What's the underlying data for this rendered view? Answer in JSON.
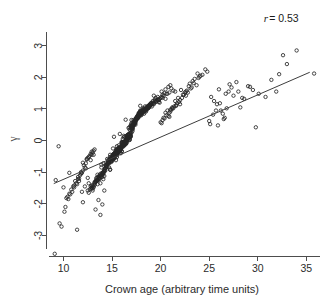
{
  "chart_data": {
    "type": "scatter",
    "title": "",
    "xlabel": "Crown age (arbitrary time units)",
    "ylabel": "γ",
    "xlim": [
      8.2,
      36.2
    ],
    "ylim": [
      -3.65,
      3.75
    ],
    "grid": false,
    "legend": null,
    "xticks": [
      10,
      15,
      20,
      25,
      30,
      35
    ],
    "xtick_labels": [
      "10",
      "15",
      "20",
      "25",
      "30",
      "35"
    ],
    "yticks": [
      -3,
      -2,
      -1,
      0,
      1,
      2,
      3
    ],
    "ytick_labels": [
      "-3",
      "-2",
      "-1",
      "0",
      "1",
      "2",
      "3"
    ],
    "ytick_label_rotation": 90,
    "marker": "open-circle",
    "marker_size_px": 3.4,
    "marker_color": "#262626",
    "point_count": 704,
    "annotations": [
      {
        "name": "correlation",
        "text_italic": "r",
        "text": "= 0.53",
        "full_text": "r = 0.53",
        "value": 0.53,
        "x_frac": 0.905,
        "y_frac": 0.072
      }
    ],
    "fit_line": {
      "type": "linear-regression",
      "x_start": 9.0,
      "y_start": -1.36,
      "x_end": 35.35,
      "y_end": 2.16,
      "slope": 0.1336,
      "intercept": -2.562,
      "color": "#3d3d3d"
    },
    "x": [
      13.1,
      15.2,
      16.4,
      14.8,
      17.9,
      12.6,
      19.3,
      16.8,
      15.5,
      18.2,
      14.1,
      17.2,
      16.0,
      13.9,
      20.1,
      15.8,
      18.7,
      16.3,
      14.6,
      17.5,
      12.9,
      19.8,
      15.1,
      16.9,
      13.4,
      18.0,
      17.1,
      14.3,
      16.6,
      15.9,
      19.1,
      13.7,
      17.8,
      16.2,
      14.9,
      18.4,
      15.4,
      20.5,
      16.7,
      13.2,
      17.3,
      15.0,
      18.9,
      16.1,
      14.4,
      19.5,
      13.8,
      17.6,
      15.7,
      16.5,
      18.1,
      14.0,
      20.8,
      15.3,
      17.0,
      13.5,
      18.6,
      16.8,
      14.7,
      19.0,
      15.6,
      17.4,
      13.0,
      18.3,
      16.4,
      14.2,
      20.2,
      15.9,
      17.7,
      13.6,
      18.8,
      16.0,
      14.5,
      19.4,
      15.2,
      17.2,
      12.8,
      18.5,
      16.6,
      14.1,
      21.0,
      15.8,
      17.9,
      13.3,
      18.2,
      16.3,
      14.8,
      19.7,
      15.5,
      17.5,
      12.5,
      18.0,
      16.9,
      14.0,
      20.4,
      15.1,
      17.1,
      13.9,
      18.7,
      16.2,
      22.1,
      21.5,
      23.0,
      20.7,
      22.8,
      21.2,
      23.5,
      20.3,
      24.1,
      21.8,
      22.4,
      20.9,
      23.8,
      21.0,
      22.0,
      24.6,
      20.6,
      23.2,
      21.6,
      22.6,
      11.5,
      12.2,
      10.9,
      11.8,
      12.4,
      10.5,
      11.2,
      12.7,
      11.0,
      12.0,
      10.7,
      11.6,
      12.9,
      11.4,
      12.3,
      10.2,
      11.9,
      12.5,
      11.1,
      12.8,
      25.2,
      26.0,
      25.8,
      27.1,
      26.4,
      25.5,
      28.0,
      26.8,
      25.0,
      27.5,
      29.2,
      26.2,
      28.6,
      25.9,
      27.8,
      30.1,
      26.6,
      29.5,
      28.2,
      31.4,
      32.2,
      30.8,
      33.0,
      31.9,
      35.8,
      34.0,
      29.8,
      32.6,
      16.1,
      15.4,
      17.6,
      16.8,
      14.9,
      18.3,
      15.7,
      17.0,
      16.4,
      14.2,
      19.2,
      15.1,
      17.8,
      16.6,
      13.8,
      18.7,
      15.9,
      17.3,
      16.0,
      14.6,
      19.9,
      15.5,
      17.1,
      16.9,
      13.4,
      18.1,
      15.2,
      17.7,
      16.3,
      14.3,
      20.6,
      15.8,
      17.4,
      16.7,
      13.1,
      18.9,
      15.0,
      17.9,
      16.5,
      14.8,
      19.6,
      15.6,
      17.2,
      16.1,
      13.7,
      18.4,
      15.3,
      17.5,
      16.2,
      14.0,
      20.9,
      15.7,
      17.0,
      16.8,
      12.7,
      18.6,
      15.4,
      18.0,
      16.0,
      14.4,
      19.3,
      15.9,
      17.6,
      16.4,
      13.2,
      18.8,
      15.1,
      17.3,
      16.6,
      14.7,
      20.0,
      15.5,
      17.8,
      16.2,
      13.6,
      18.2,
      15.8,
      17.1,
      16.9,
      14.1,
      21.3,
      15.3,
      17.7,
      16.5,
      12.9,
      18.5,
      15.6,
      17.4,
      16.0,
      14.5,
      19.8,
      15.2,
      17.9,
      16.3,
      13.3,
      18.3,
      15.9,
      17.2,
      16.7,
      14.9,
      16.2,
      15.5,
      17.5,
      16.9,
      14.3,
      18.0,
      15.0,
      17.6,
      16.1,
      13.5,
      19.1,
      15.7,
      17.0,
      16.8,
      14.0,
      18.7,
      15.4,
      17.8,
      16.4,
      14.6,
      20.3,
      15.1,
      17.3,
      16.0,
      13.0,
      18.4,
      15.8,
      17.7,
      16.6,
      14.2,
      19.4,
      15.3,
      17.1,
      16.2,
      13.9,
      18.9,
      15.6,
      17.9,
      16.5,
      14.8,
      21.1,
      15.0,
      17.4,
      16.3,
      12.6,
      18.1,
      15.9,
      17.2,
      16.7,
      14.4,
      19.7,
      15.5,
      17.6,
      16.1,
      13.8,
      18.6,
      15.2,
      17.0,
      16.9,
      14.1,
      20.7,
      15.7,
      17.5,
      16.4,
      13.4,
      18.3,
      15.4,
      17.8,
      16.0,
      14.7,
      19.0,
      15.8,
      17.3,
      16.6,
      13.7,
      18.8,
      15.1,
      17.7,
      16.2,
      14.3,
      22.3,
      21.7,
      20.5,
      22.9,
      21.1,
      23.4,
      20.8,
      22.5,
      21.4,
      23.9,
      20.2,
      22.7,
      21.9,
      24.3,
      20.4,
      23.1,
      21.3,
      22.2,
      24.8,
      20.0,
      12.1,
      11.7,
      12.6,
      11.3,
      13.0,
      10.8,
      12.8,
      11.5,
      13.2,
      10.4,
      12.3,
      11.1,
      12.9,
      10.6,
      11.8,
      13.1,
      12.0,
      11.6,
      10.1,
      12.4,
      16.5,
      15.2,
      17.9,
      16.1,
      14.5,
      18.2,
      15.8,
      17.4,
      16.7,
      13.3,
      19.5,
      15.4,
      17.0,
      16.3,
      14.0,
      18.7,
      15.0,
      17.6,
      16.9,
      14.6,
      20.1,
      15.6,
      17.2,
      16.4,
      13.6,
      18.0,
      15.3,
      17.8,
      16.0,
      14.2,
      19.2,
      15.9,
      17.5,
      16.6,
      13.1,
      18.5,
      15.7,
      17.1,
      16.2,
      14.9,
      21.5,
      15.1,
      17.7,
      16.8,
      12.8,
      18.9,
      15.5,
      17.3,
      16.5,
      14.4,
      19.8,
      15.2,
      17.9,
      16.1,
      13.5,
      18.4,
      15.8,
      17.0,
      16.7,
      14.7,
      9.2,
      9.8,
      9.5,
      10.0,
      9.6,
      10.3,
      9.1,
      10.6,
      16.0,
      15.5,
      17.5,
      16.5,
      14.5,
      18.5,
      15.0,
      17.0,
      16.8,
      14.0,
      19.0,
      15.7,
      17.7,
      16.2,
      13.5,
      18.2,
      15.3,
      17.2,
      16.6,
      14.8,
      20.5,
      15.9,
      17.4,
      16.3,
      13.8,
      18.8,
      15.1,
      17.8,
      16.0,
      14.3,
      19.6,
      15.6,
      17.1,
      16.9,
      13.0,
      18.1,
      15.4,
      17.6,
      16.4,
      14.6,
      22.0,
      21.2,
      20.9,
      23.3,
      21.6,
      22.6,
      20.1,
      24.0,
      21.0,
      23.7,
      16.3,
      15.8,
      17.3,
      16.1,
      14.1,
      18.6,
      15.2,
      17.9,
      16.7,
      14.9,
      19.3,
      15.5,
      17.5,
      16.0,
      13.2,
      18.0,
      15.9,
      17.2,
      16.8,
      14.4,
      20.2,
      15.0,
      17.6,
      16.5,
      13.7,
      18.4,
      15.6,
      17.0,
      16.2,
      14.2,
      19.9,
      15.3,
      17.8,
      16.6,
      12.9,
      18.3,
      15.7,
      17.4,
      16.4,
      14.5,
      12.2,
      13.6,
      11.9,
      14.0,
      12.5,
      13.8,
      11.4,
      14.2,
      12.0,
      13.3,
      25.4,
      26.7,
      25.1,
      27.3,
      26.1,
      28.4,
      25.7,
      27.0,
      26.5,
      29.0,
      16.2,
      15.4,
      17.1,
      16.6,
      14.7,
      18.8,
      15.1,
      17.7,
      16.0,
      13.4,
      19.1,
      15.8,
      17.3,
      16.9,
      14.1,
      18.5,
      15.5,
      17.0,
      16.3,
      14.8
    ],
    "y": [
      -0.45,
      0.12,
      0.66,
      -0.92,
      1.1,
      -1.35,
      1.42,
      0.35,
      -0.18,
      0.88,
      -1.05,
      0.54,
      -0.33,
      -0.76,
      1.55,
      0.21,
      1.02,
      -0.08,
      -0.61,
      0.73,
      -1.48,
      1.28,
      -0.25,
      0.47,
      -1.18,
      0.95,
      0.3,
      -0.88,
      0.05,
      -0.4,
      1.2,
      -1.22,
      0.82,
      -0.14,
      -0.55,
      1.08,
      -0.31,
      1.62,
      0.4,
      -1.4,
      0.6,
      -0.48,
      1.15,
      -0.05,
      -0.8,
      1.35,
      -1.1,
      0.7,
      -0.22,
      0.15,
      0.9,
      -1.02,
      1.7,
      -0.38,
      0.25,
      -1.25,
      1.05,
      0.42,
      -0.68,
      1.18,
      -0.28,
      0.58,
      -1.52,
      0.98,
      -0.1,
      -0.95,
      1.45,
      -0.2,
      0.75,
      -1.15,
      1.12,
      -0.35,
      -0.72,
      1.3,
      -0.42,
      0.5,
      -1.45,
      1.0,
      0.18,
      -1.0,
      1.75,
      -0.3,
      0.85,
      -1.3,
      0.92,
      -0.12,
      -0.58,
      1.38,
      -0.26,
      0.68,
      -1.58,
      0.8,
      0.32,
      -1.08,
      1.5,
      -0.44,
      0.38,
      -0.85,
      1.06,
      -0.06,
      1.6,
      1.25,
      1.8,
      0.95,
      1.52,
      1.05,
      1.95,
      0.72,
      2.05,
      1.35,
      1.45,
      0.88,
      2.12,
      0.98,
      1.15,
      2.25,
      0.8,
      1.68,
      1.1,
      1.55,
      -1.15,
      -0.85,
      -1.62,
      -1.05,
      -0.6,
      -1.85,
      -1.28,
      -0.48,
      -1.45,
      -0.95,
      -1.7,
      -1.2,
      -0.35,
      -1.38,
      -0.72,
      -2.1,
      -1.02,
      -0.55,
      -1.48,
      -0.42,
      1.38,
      1.62,
      1.15,
      1.78,
      0.85,
      1.25,
      1.55,
      1.02,
      0.62,
      1.42,
      1.7,
      0.95,
      1.32,
      0.48,
      1.85,
      1.48,
      0.72,
      1.6,
      1.05,
      1.92,
      2.1,
      1.38,
      2.42,
      1.55,
      2.12,
      2.85,
      0.42,
      2.7,
      0.05,
      -0.35,
      0.78,
      0.22,
      -0.68,
      0.98,
      -0.15,
      0.45,
      -0.02,
      -1.12,
      1.25,
      -0.52,
      0.85,
      0.1,
      -1.35,
      1.02,
      -0.28,
      0.62,
      -0.08,
      -0.72,
      1.32,
      -0.4,
      0.35,
      0.18,
      -1.25,
      0.88,
      -0.58,
      0.72,
      -0.12,
      -0.95,
      1.48,
      -0.22,
      0.55,
      0.08,
      -1.48,
      1.12,
      -0.65,
      0.92,
      -0.05,
      -0.45,
      1.28,
      -0.32,
      0.48,
      -0.18,
      -1.18,
      0.95,
      -0.48,
      0.65,
      -0.1,
      -1.05,
      1.52,
      -0.25,
      0.4,
      0.02,
      -1.55,
      1.08,
      -0.38,
      0.82,
      -0.2,
      -0.8,
      1.18,
      -0.28,
      0.75,
      -0.04,
      -1.32,
      1.05,
      -0.55,
      0.52,
      0.12,
      -0.62,
      1.35,
      -0.42,
      0.88,
      -0.16,
      -1.22,
      0.92,
      -0.3,
      0.42,
      0.15,
      -1.02,
      1.58,
      -0.5,
      0.8,
      0.06,
      -1.42,
      1.0,
      -0.35,
      0.68,
      -0.18,
      -0.75,
      1.22,
      -0.45,
      0.95,
      -0.08,
      -1.28,
      0.85,
      -0.26,
      0.58,
      0.2,
      -0.55,
      -0.12,
      -0.42,
      0.7,
      0.25,
      -0.88,
      0.92,
      -0.58,
      0.75,
      -0.15,
      -1.25,
      1.15,
      -0.32,
      0.48,
      0.1,
      -1.08,
      1.05,
      -0.48,
      0.82,
      -0.02,
      -0.65,
      1.42,
      -0.55,
      0.6,
      -0.22,
      -1.58,
      0.98,
      -0.28,
      0.78,
      0.05,
      -0.98,
      1.25,
      -0.38,
      0.45,
      -0.12,
      -1.15,
      1.1,
      -0.3,
      0.88,
      0.02,
      -0.52,
      1.65,
      -0.62,
      0.65,
      -0.06,
      -1.65,
      0.9,
      -0.24,
      0.52,
      0.16,
      -0.82,
      1.3,
      -0.35,
      0.72,
      -0.14,
      -1.12,
      1.02,
      -0.45,
      0.38,
      0.22,
      -1.0,
      1.48,
      -0.28,
      0.68,
      0.0,
      -1.2,
      0.95,
      -0.42,
      0.85,
      -0.2,
      -0.68,
      1.12,
      -0.32,
      0.55,
      0.08,
      -1.18,
      1.08,
      -0.52,
      0.8,
      -0.1,
      -0.78,
      1.45,
      1.18,
      0.88,
      1.72,
      0.98,
      1.82,
      0.78,
      1.52,
      1.08,
      1.98,
      0.65,
      1.58,
      1.22,
      2.08,
      0.7,
      1.65,
      1.02,
      1.35,
      2.18,
      0.58,
      -0.78,
      -1.1,
      -0.52,
      -1.35,
      -0.38,
      -1.55,
      -0.62,
      -1.22,
      -0.28,
      -1.78,
      -0.88,
      -1.42,
      -0.45,
      -1.68,
      -1.0,
      -0.32,
      -0.7,
      -1.28,
      -2.25,
      -0.58,
      0.08,
      -0.48,
      0.85,
      -0.1,
      -0.82,
      1.02,
      -0.25,
      0.62,
      0.18,
      -1.32,
      1.22,
      -0.38,
      0.42,
      -0.05,
      -1.02,
      1.08,
      -0.58,
      0.75,
      0.12,
      -0.68,
      1.38,
      -0.3,
      0.52,
      -0.02,
      -1.15,
      0.92,
      -0.45,
      0.88,
      -0.18,
      -0.92,
      1.18,
      -0.22,
      0.68,
      0.05,
      -1.45,
      1.0,
      -0.35,
      0.48,
      0.15,
      -0.58,
      1.55,
      -0.52,
      0.78,
      0.1,
      -1.52,
      1.12,
      -0.28,
      0.58,
      -0.08,
      -0.85,
      1.28,
      -0.42,
      0.82,
      -0.15,
      -1.08,
      0.95,
      -0.32,
      0.45,
      0.2,
      -0.72,
      -1.25,
      -2.72,
      -0.18,
      -1.48,
      -2.62,
      -1.82,
      -3.58,
      -1.02,
      -0.05,
      -0.38,
      0.72,
      0.15,
      -0.75,
      0.95,
      -0.52,
      0.55,
      0.02,
      -1.15,
      1.18,
      -0.28,
      0.85,
      -0.12,
      -1.38,
      0.98,
      -0.48,
      0.65,
      0.08,
      -0.62,
      1.32,
      -0.22,
      0.5,
      -0.06,
      -1.05,
      1.05,
      -0.58,
      0.78,
      -0.2,
      -0.88,
      1.25,
      -0.35,
      0.42,
      0.12,
      -1.42,
      0.88,
      -0.45,
      0.7,
      0.0,
      -0.7,
      1.28,
      1.02,
      0.75,
      1.88,
      1.12,
      1.42,
      0.55,
      2.02,
      0.92,
      1.75,
      0.12,
      -0.32,
      0.58,
      -0.08,
      -1.22,
      1.0,
      -0.55,
      0.82,
      0.18,
      -0.65,
      1.15,
      -0.42,
      0.68,
      -0.15,
      -1.35,
      0.9,
      -0.25,
      0.48,
      0.05,
      -0.78,
      1.35,
      -0.6,
      0.72,
      -0.02,
      -1.1,
      0.98,
      -0.38,
      0.52,
      0.1,
      -0.95,
      1.2,
      -0.48,
      0.88,
      0.02,
      -1.5,
      1.02,
      -0.28,
      0.62,
      -0.12,
      -0.58,
      -1.45,
      -1.88,
      -1.62,
      -2.02,
      -1.18,
      -2.35,
      -2.82,
      -1.58,
      -1.95,
      -2.18,
      0.82,
      1.48,
      0.52,
      1.68,
      1.18,
      1.35,
      0.95,
      1.55,
      0.68,
      1.72,
      -0.18,
      -0.62,
      0.38,
      0.08,
      -0.85,
      1.1,
      -0.45,
      0.75,
      -0.05,
      -1.28,
      1.08,
      -0.35,
      0.55,
      0.15,
      -0.72,
      0.92,
      -0.52,
      0.65,
      -0.1,
      -0.92
    ]
  },
  "axes": {
    "x_axis_name": "x-axis",
    "y_axis_name": "y-axis"
  }
}
